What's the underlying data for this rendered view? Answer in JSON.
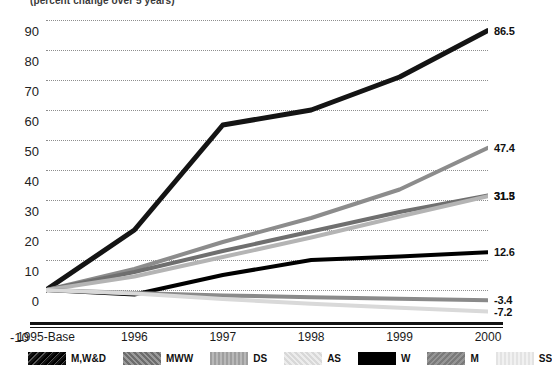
{
  "subtitle": "(percent change over 5 years)",
  "axis": {
    "y_ticks": [
      "90",
      "80",
      "70",
      "60",
      "50",
      "40",
      "30",
      "20",
      "10",
      "0"
    ],
    "y_tick_neg": "-10",
    "x_ticks": [
      "1995-Base",
      "1996",
      "1997",
      "1998",
      "1999",
      "2000"
    ]
  },
  "end_labels": {
    "mwd": "86.5",
    "as": "47.4",
    "mww": "31.5",
    "ds": "31.3",
    "w": "12.6",
    "m": "-3.4",
    "ss": "-7.2"
  },
  "legend": {
    "items": [
      {
        "label": "M,W&D",
        "swatch": "tex-mwd"
      },
      {
        "label": "MWW",
        "swatch": "tex-mww"
      },
      {
        "label": "DS",
        "swatch": "tex-ds"
      },
      {
        "label": "AS",
        "swatch": "tex-as"
      },
      {
        "label": "W",
        "swatch": "tex-w"
      },
      {
        "label": "M",
        "swatch": "tex-m"
      },
      {
        "label": "SS",
        "swatch": "tex-ss"
      }
    ]
  },
  "chart_data": {
    "type": "line",
    "title": "",
    "subtitle": "(percent change over 5 years)",
    "xlabel": "",
    "ylabel": "",
    "ylim": [
      -10,
      90
    ],
    "y_ticks": [
      -10,
      0,
      10,
      20,
      30,
      40,
      50,
      60,
      70,
      80,
      90
    ],
    "grid": true,
    "legend_position": "bottom",
    "x": [
      "1995-Base",
      "1996",
      "1997",
      "1998",
      "1999",
      "2000"
    ],
    "series": [
      {
        "name": "M,W&D",
        "color": "#141414",
        "values": [
          0,
          20.0,
          55.0,
          60.0,
          71.0,
          86.5
        ],
        "end_label": 86.5
      },
      {
        "name": "AS",
        "color": "#8c8c8c",
        "values": [
          0,
          7.0,
          16.0,
          24.0,
          33.5,
          47.4
        ],
        "end_label": 47.4
      },
      {
        "name": "MWW",
        "color": "#6f6f6f",
        "values": [
          0,
          6.0,
          13.0,
          19.5,
          26.0,
          31.5
        ],
        "end_label": 31.5
      },
      {
        "name": "DS",
        "color": "#b4b4b4",
        "values": [
          0,
          4.5,
          11.0,
          17.5,
          24.5,
          31.3
        ],
        "end_label": 31.3
      },
      {
        "name": "W",
        "color": "#000000",
        "values": [
          0,
          -1.5,
          5.0,
          10.0,
          11.2,
          12.6
        ],
        "end_label": 12.6
      },
      {
        "name": "M",
        "color": "#8a8a8a",
        "values": [
          0,
          -1.0,
          -1.8,
          -2.4,
          -2.9,
          -3.4
        ],
        "end_label": -3.4
      },
      {
        "name": "SS",
        "color": "#d9d9d9",
        "values": [
          0,
          -1.2,
          -3.0,
          -4.6,
          -5.9,
          -7.2
        ],
        "end_label": -7.2
      }
    ]
  }
}
